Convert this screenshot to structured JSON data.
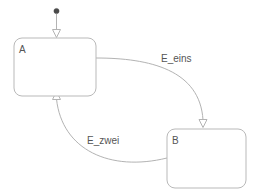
{
  "diagram": {
    "type": "uml-state-machine",
    "background_color": "#ffffff",
    "stroke_color": "#b3b3b3",
    "text_color": "#555555",
    "initial_node": {
      "name": "initial-pseudostate",
      "shape": "filled-circle",
      "color": "#4a4a4a",
      "cx": 56.5,
      "cy": 11,
      "r": 2.6
    },
    "states": [
      {
        "id": "A",
        "label": "A",
        "x": 14,
        "y": 38,
        "width": 82,
        "height": 58,
        "corner_radius": 8,
        "label_x": 19,
        "label_y": 53
      },
      {
        "id": "B",
        "label": "B",
        "x": 167,
        "y": 129,
        "width": 79,
        "height": 59,
        "corner_radius": 8,
        "label_x": 172,
        "label_y": 144
      }
    ],
    "transitions": [
      {
        "id": "initial-to-A",
        "label": "",
        "from": "initial-pseudostate",
        "to": "A",
        "path": "M 56.5 14 L 56.5 30",
        "arrow_head": "M 52.5 29.5 L 60.5 29.5 L 56.5 37.5 Z"
      },
      {
        "id": "A-to-B",
        "label": "E_eins",
        "from": "A",
        "to": "B",
        "path": "M 96 58 C 150 58 200 70 203 120",
        "arrow_head": "M 199 119.5 L 207 119.5 L 203 127.5 Z",
        "label_x": 161,
        "label_y": 62
      },
      {
        "id": "B-to-A",
        "label": "E_zwei",
        "from": "B",
        "to": "A",
        "path": "M 167 158 C 110 172 62 150 56.5 99",
        "arrow_head": "M 52.5 99.5 L 60.5 99.5 L 56.5 91.5 Z",
        "label_x": 87,
        "label_y": 144
      }
    ]
  }
}
